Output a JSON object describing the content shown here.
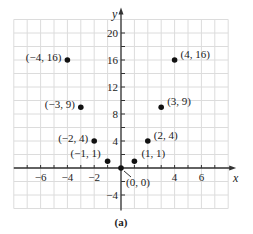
{
  "chart_data": {
    "type": "scatter",
    "title": "",
    "caption": "(a)",
    "xlabel": "x",
    "ylabel": "y",
    "xlim": [
      -8,
      8
    ],
    "ylim": [
      -6,
      22
    ],
    "grid": true,
    "x_ticks": [
      -6,
      -4,
      -2,
      4,
      6
    ],
    "y_ticks": [
      20,
      16,
      12,
      8,
      4,
      -4
    ],
    "points": [
      {
        "x": -4,
        "y": 16,
        "label": "(−4, 16)"
      },
      {
        "x": -3,
        "y": 9,
        "label": "(−3, 9)"
      },
      {
        "x": -2,
        "y": 4,
        "label": "(−2, 4)"
      },
      {
        "x": -1,
        "y": 1,
        "label": "(−1, 1)"
      },
      {
        "x": 0,
        "y": 0,
        "label": "(0, 0)"
      },
      {
        "x": 1,
        "y": 1,
        "label": "(1, 1)"
      },
      {
        "x": 2,
        "y": 4,
        "label": "(2, 4)"
      },
      {
        "x": 3,
        "y": 9,
        "label": "(3, 9)"
      },
      {
        "x": 4,
        "y": 16,
        "label": "(4, 16)"
      }
    ]
  }
}
